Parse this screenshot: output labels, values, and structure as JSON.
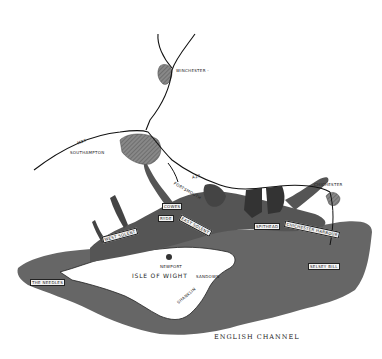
{
  "map": {
    "title": "",
    "colors": {
      "sea": "#5f5f5f",
      "sea_dark": "#3f3f3f",
      "land": "#ffffff",
      "road": "#111111",
      "town": "#777777"
    },
    "towns": [
      {
        "name": "Winchester",
        "label": "WINCHESTER -"
      },
      {
        "name": "Southampton",
        "label": "SOUTHAMPTON"
      },
      {
        "name": "Portsmouth",
        "label": "PORTSMOUTH"
      },
      {
        "name": "Chichester",
        "label": "CHICHESTER"
      },
      {
        "name": "Newport",
        "label": "NEWPORT"
      },
      {
        "name": "Sandown",
        "label": "SANDOWN"
      },
      {
        "name": "Shanklin",
        "label": "SHANKLIN"
      }
    ],
    "roads": [
      {
        "label": "M27"
      },
      {
        "label": "A27"
      }
    ],
    "water_labels": {
      "west_solent": "WEST SOLENT",
      "east_solent": "EAST SOLENT",
      "spithead": "SPITHEAD",
      "cowes": "COWES",
      "ryde": "RYDE",
      "chichester_harbour": "CHICHESTER HARBOUR",
      "selsey_bill": "SELSEY BILL",
      "the_needles": "THE NEEDLES",
      "bognor": "BOGNOR",
      "isle_of_wight": "ISLE OF WIGHT",
      "english_channel": "ENGLISH CHANNEL"
    }
  }
}
